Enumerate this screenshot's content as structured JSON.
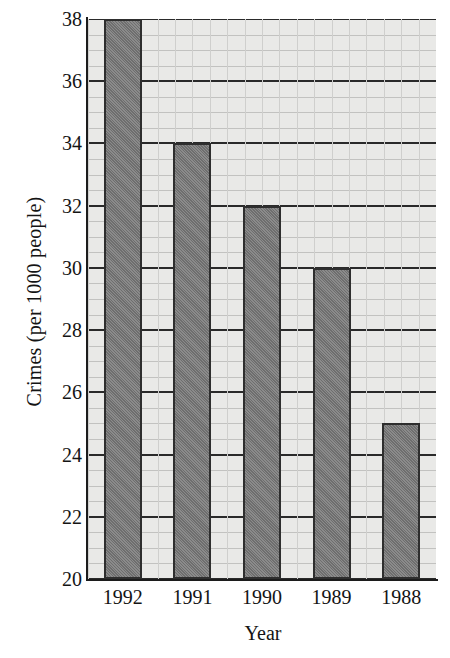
{
  "chart_data": {
    "type": "bar",
    "title": "",
    "xlabel": "Year",
    "ylabel": "Crimes (per 1000 people)",
    "categories": [
      "1992",
      "1991",
      "1990",
      "1989",
      "1988"
    ],
    "values": [
      38,
      34,
      32,
      30,
      25
    ],
    "ylim": [
      20,
      38
    ],
    "xlim_note": "categorical, 5 bars",
    "ytick_labels": [
      "20",
      "22",
      "24",
      "26",
      "28",
      "30",
      "32",
      "34",
      "36",
      "38"
    ],
    "ytick_values": [
      20,
      22,
      24,
      26,
      28,
      30,
      32,
      34,
      36,
      38
    ],
    "minor_tick_step": 0.5,
    "grid": "major horizontal dark, minor horizontal and vertical light",
    "legend": "none",
    "colors": {
      "bar_fill": "#7a7a7a",
      "bar_edge": "#2e2e2e",
      "plot_background": "#e9e9e7",
      "major_gridline": "#2a2a2a",
      "minor_gridline": "#c2c2c0",
      "axis": "#1c1c1c",
      "text": "#141414",
      "page_background": "#ffffff"
    }
  }
}
